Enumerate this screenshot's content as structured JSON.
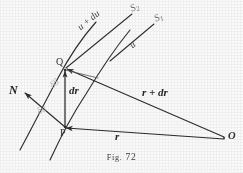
{
  "figure": {
    "caption_prefix": "Fig.",
    "caption_number": "72",
    "background_color": "#fafafa",
    "ink_color": "#2b2b2b",
    "faint_ink_color": "#b9b9b9"
  },
  "points": {
    "q": "Q",
    "p": "P",
    "o": "O"
  },
  "labels": {
    "surface_2": "S",
    "surface_2_sub": "2",
    "surface_1": "S",
    "surface_1_sub": "1",
    "u_plus_du": "u + du",
    "u": "u",
    "normal": "N",
    "dr": "dr",
    "r_plus_dr": "r + dr",
    "r": "r",
    "delta_s": "δS",
    "delta_u": "δu"
  },
  "geometry": {
    "note": "vector diagram of a scalar field: two level curves S1 and S2 with u and u+du, position vectors r and r+dr from origin O, normal N at P"
  }
}
